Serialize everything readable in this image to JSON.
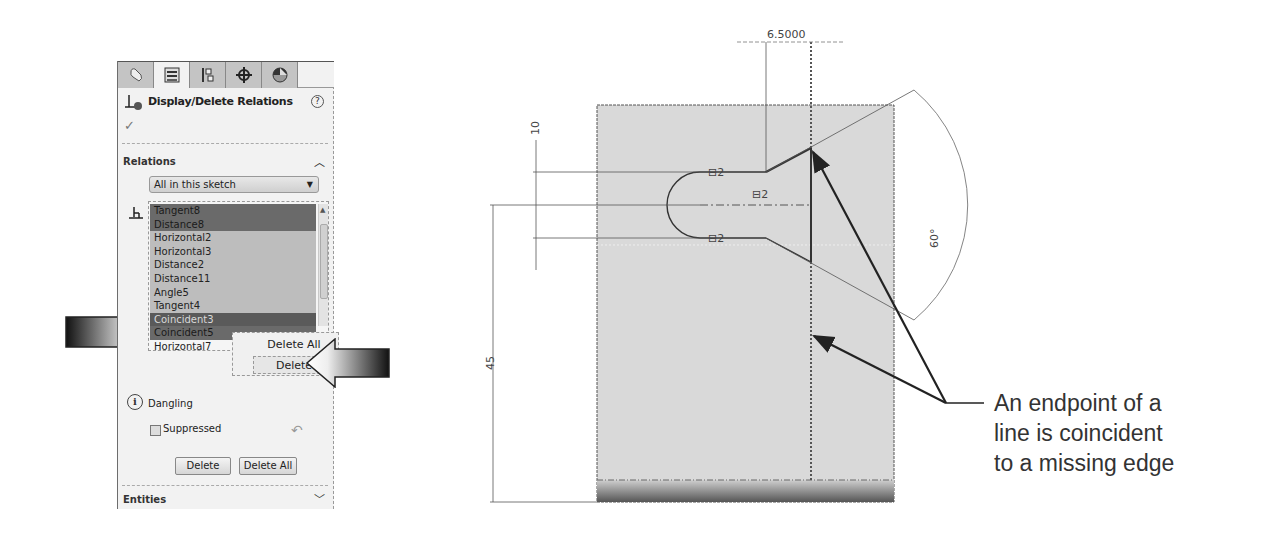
{
  "property_manager": {
    "tabs": [
      {
        "icon": "feature-manager-icon",
        "active": false
      },
      {
        "icon": "property-manager-icon",
        "active": true
      },
      {
        "icon": "configuration-manager-icon",
        "active": false
      },
      {
        "icon": "dimxpert-manager-icon",
        "active": false
      },
      {
        "icon": "display-manager-icon",
        "active": false
      }
    ],
    "title": "Display/Delete Relations",
    "help_label": "?",
    "ok_label": "✓",
    "relations_section": {
      "label": "Relations",
      "filter_value": "All in this sketch",
      "list": [
        {
          "label": "Tangent8",
          "state": "selected"
        },
        {
          "label": "Distance8",
          "state": "selected"
        },
        {
          "label": "Horizontal2",
          "state": "normal"
        },
        {
          "label": "Horizontal3",
          "state": "normal"
        },
        {
          "label": "Distance2",
          "state": "normal"
        },
        {
          "label": "Distance11",
          "state": "normal"
        },
        {
          "label": "Angle5",
          "state": "normal"
        },
        {
          "label": "Tangent4",
          "state": "normal"
        },
        {
          "label": "Coincident3",
          "state": "selected-dangling"
        },
        {
          "label": "Coincident5",
          "state": "selected"
        },
        {
          "label": "Horizontal7",
          "state": "plain"
        },
        {
          "label": "Vertical4",
          "state": "plain"
        }
      ],
      "context_menu": {
        "items": [
          {
            "label": "Delete All",
            "highlighted": false
          },
          {
            "label": "Delete",
            "highlighted": true
          }
        ]
      },
      "status_label": "Dangling",
      "suppressed_label": "Suppressed",
      "suppressed_checked": false,
      "delete_button": "Delete",
      "delete_all_button": "Delete All"
    },
    "entities_section": {
      "label": "Entities"
    }
  },
  "sketch": {
    "dimensions": {
      "top_width": "6.5000",
      "slot_width": "10",
      "height": "45",
      "angle": "60°"
    },
    "relation_glyph": "⊟2"
  },
  "annotation": {
    "lines": [
      "An endpoint of a",
      "line is coincident",
      "to a missing edge"
    ]
  },
  "colors": {
    "panel_bg": "#f2f2f2",
    "list_selected": "#6a6a6a",
    "list_normal": "#bdbdbd",
    "sketch_fill": "#d9d9d9",
    "arrow_dark": "#222222"
  }
}
